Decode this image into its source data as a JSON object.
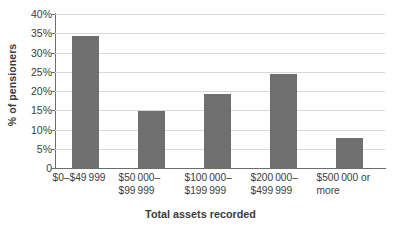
{
  "chart_data": {
    "type": "bar",
    "title": "",
    "xlabel": "Total assets recorded",
    "ylabel": "% of pensioners",
    "categories": [
      "$0–$49 999",
      "$50 000–\n$99 999",
      "$100 000–\n$199 999",
      "$200 000–\n$499 999",
      "$500 000 or\nmore"
    ],
    "values": [
      34.3,
      14.7,
      19.2,
      24.5,
      7.8
    ],
    "ylim": [
      0,
      40
    ],
    "ytick_values": [
      0,
      5,
      10,
      15,
      20,
      25,
      30,
      35,
      40
    ],
    "ytick_labels": [
      "0",
      "5%",
      "10%",
      "15%",
      "20%",
      "25%",
      "30%",
      "35%",
      "40%"
    ],
    "grid": true,
    "legend": false,
    "legend_position": "none",
    "bar_color": "#706f70",
    "gridline_color": "#d9d9d9",
    "axis_color": "#6d6d6d",
    "text_color": "#3c3c3c",
    "background_color": "#ffffff"
  }
}
